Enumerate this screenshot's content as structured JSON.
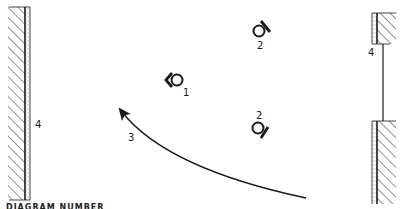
{
  "diagram": {
    "type": "floor-plan-schematic",
    "walls": [
      {
        "id": "left-wall",
        "label": "4"
      },
      {
        "id": "right-wall-upper",
        "label": "4"
      },
      {
        "id": "right-wall-lower",
        "label": ""
      }
    ],
    "fixtures": [
      {
        "id": "fixture-1",
        "label": "1"
      },
      {
        "id": "fixture-2-top",
        "label": "2"
      },
      {
        "id": "fixture-2-bottom",
        "label": "2"
      }
    ],
    "path": {
      "id": "movement-arrow",
      "label": "3"
    },
    "caption": "DIAGRAM NUMBER"
  },
  "colors": {
    "ink": "#1a1a1a",
    "background": "#ffffff",
    "stipple": "#8a8a8a"
  }
}
